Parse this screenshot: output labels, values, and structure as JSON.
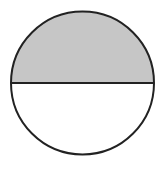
{
  "diagram": {
    "shape": "circle",
    "circle": {
      "cx": 82.5,
      "cy": 83,
      "r": 71.5
    },
    "divider": {
      "orientation": "horizontal",
      "y": 83
    },
    "regions": [
      {
        "name": "top-half",
        "fraction": "1/2",
        "shaded": true,
        "fill": "#c6c6c6"
      },
      {
        "name": "bottom-half",
        "fraction": "1/2",
        "shaded": false,
        "fill": "#ffffff"
      }
    ],
    "stroke_color": "#222222",
    "stroke_width": 2,
    "shaded_fraction": "1/2"
  }
}
